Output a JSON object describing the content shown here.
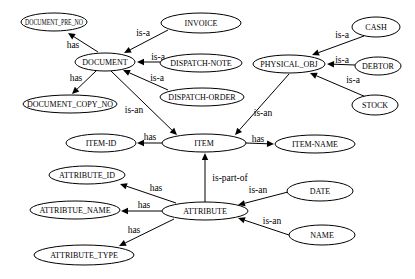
{
  "diagram": {
    "type": "entity-relationship graph",
    "nodes": [
      {
        "id": "DOCUMENT_PRE_NO",
        "label": "DOCUMENT_PRE_NO",
        "cx": 54,
        "cy": 22,
        "rx": 33,
        "ry": 9
      },
      {
        "id": "INVOICE",
        "label": "INVOICE",
        "cx": 201,
        "cy": 23,
        "rx": 40,
        "ry": 10
      },
      {
        "id": "DOCUMENT",
        "label": "DOCUMENT",
        "cx": 105,
        "cy": 62,
        "rx": 30,
        "ry": 9
      },
      {
        "id": "DISPATCH-NOTE",
        "label": "DISPATCH-NOTE",
        "cx": 201,
        "cy": 63,
        "rx": 41,
        "ry": 9
      },
      {
        "id": "DISPATCH-ORDER",
        "label": "DISPATCH-ORDER",
        "cx": 202,
        "cy": 97,
        "rx": 42,
        "ry": 9
      },
      {
        "id": "DOCUMENT_COPY_NO",
        "label": "DOCUMENT_COPY_NO",
        "cx": 70,
        "cy": 104,
        "rx": 47,
        "ry": 9
      },
      {
        "id": "CASH",
        "label": "CASH",
        "cx": 376,
        "cy": 27,
        "rx": 24,
        "ry": 10
      },
      {
        "id": "PHYSICAL_OBJ",
        "label": "PHYSICAL_OBJ",
        "cx": 289,
        "cy": 64,
        "rx": 36,
        "ry": 9
      },
      {
        "id": "DEBTOR",
        "label": "DEBTOR",
        "cx": 378,
        "cy": 66,
        "rx": 23,
        "ry": 9
      },
      {
        "id": "STOCK",
        "label": "STOCK",
        "cx": 375,
        "cy": 105,
        "rx": 23,
        "ry": 10
      },
      {
        "id": "ITEM-ID",
        "label": "ITEM-ID",
        "cx": 101,
        "cy": 143,
        "rx": 35,
        "ry": 9
      },
      {
        "id": "ITEM",
        "label": "ITEM",
        "cx": 204,
        "cy": 143,
        "rx": 42,
        "ry": 9
      },
      {
        "id": "ITEM-NAME",
        "label": "ITEM-NAME",
        "cx": 315,
        "cy": 144,
        "rx": 40,
        "ry": 9
      },
      {
        "id": "ATTRIBUTE_ID",
        "label": "ATTRIBUTE_ID",
        "cx": 87,
        "cy": 175,
        "rx": 38,
        "ry": 9
      },
      {
        "id": "DATE",
        "label": "DATE",
        "cx": 320,
        "cy": 191,
        "rx": 33,
        "ry": 10
      },
      {
        "id": "ATTRIBTUE_NAME",
        "label": "ATTRIBTUE_NAME",
        "cx": 75,
        "cy": 210,
        "rx": 45,
        "ry": 9
      },
      {
        "id": "ATTRIBUTE",
        "label": "ATTRIBUTE",
        "cx": 205,
        "cy": 211,
        "rx": 43,
        "ry": 9
      },
      {
        "id": "NAME",
        "label": "NAME",
        "cx": 322,
        "cy": 235,
        "rx": 33,
        "ry": 10
      },
      {
        "id": "ATTRIBUTE_TYPE",
        "label": "ATTRIBUTE_TYPE",
        "cx": 84,
        "cy": 255,
        "rx": 50,
        "ry": 10
      }
    ],
    "edges": [
      {
        "from": "DOCUMENT",
        "to": "DOCUMENT_PRE_NO",
        "label": "has",
        "x1": 98,
        "y1": 52,
        "x2": 68,
        "y2": 33,
        "lx": 73,
        "ly": 45
      },
      {
        "from": "DOCUMENT",
        "to": "DOCUMENT_COPY_NO",
        "label": "has",
        "x1": 96,
        "y1": 71,
        "x2": 72,
        "y2": 94,
        "lx": 76,
        "ly": 78
      },
      {
        "from": "INVOICE",
        "to": "DOCUMENT",
        "label": "is-a",
        "x1": 168,
        "y1": 30,
        "x2": 124,
        "y2": 53,
        "lx": 143,
        "ly": 33
      },
      {
        "from": "DISPATCH-NOTE",
        "to": "DOCUMENT",
        "label": "is-a",
        "x1": 160,
        "y1": 62,
        "x2": 137,
        "y2": 62,
        "lx": 158,
        "ly": 57
      },
      {
        "from": "DISPATCH-ORDER",
        "to": "DOCUMENT",
        "label": "is-a",
        "x1": 168,
        "y1": 90,
        "x2": 123,
        "y2": 70,
        "lx": 157,
        "ly": 78
      },
      {
        "from": "DOCUMENT",
        "to": "ITEM",
        "label": "is-an",
        "x1": 111,
        "y1": 71,
        "x2": 177,
        "y2": 135,
        "lx": 134,
        "ly": 110
      },
      {
        "from": "CASH",
        "to": "PHYSICAL_OBJ",
        "label": "is-a",
        "x1": 364,
        "y1": 36,
        "x2": 312,
        "y2": 55,
        "lx": 342,
        "ly": 35
      },
      {
        "from": "DEBTOR",
        "to": "PHYSICAL_OBJ",
        "label": "is-a",
        "x1": 355,
        "y1": 65,
        "x2": 327,
        "y2": 64,
        "lx": 342,
        "ly": 60
      },
      {
        "from": "STOCK",
        "to": "PHYSICAL_OBJ",
        "label": "is-a",
        "x1": 366,
        "y1": 97,
        "x2": 310,
        "y2": 73,
        "lx": 353,
        "ly": 80
      },
      {
        "from": "PHYSICAL_OBJ",
        "to": "ITEM",
        "label": "is-an",
        "x1": 289,
        "y1": 74,
        "x2": 235,
        "y2": 135,
        "lx": 263,
        "ly": 113
      },
      {
        "from": "ITEM",
        "to": "ITEM-ID",
        "label": "has",
        "x1": 162,
        "y1": 143,
        "x2": 137,
        "y2": 143,
        "lx": 150,
        "ly": 137
      },
      {
        "from": "ITEM",
        "to": "ITEM-NAME",
        "label": "has",
        "x1": 246,
        "y1": 143,
        "x2": 274,
        "y2": 144,
        "lx": 258,
        "ly": 139
      },
      {
        "from": "ATTRIBUTE",
        "to": "ITEM",
        "label": "is-part-of",
        "x1": 205,
        "y1": 202,
        "x2": 205,
        "y2": 153,
        "lx": 230,
        "ly": 178
      },
      {
        "from": "ATTRIBUTE",
        "to": "ATTRIBUTE_ID",
        "label": "has",
        "x1": 176,
        "y1": 203,
        "x2": 120,
        "y2": 184,
        "lx": 156,
        "ly": 188
      },
      {
        "from": "ATTRIBUTE",
        "to": "ATTRIBTUE_NAME",
        "label": "has",
        "x1": 162,
        "y1": 211,
        "x2": 121,
        "y2": 211,
        "lx": 144,
        "ly": 205
      },
      {
        "from": "ATTRIBUTE",
        "to": "ATTRIBUTE_TYPE",
        "label": "has",
        "x1": 174,
        "y1": 219,
        "x2": 119,
        "y2": 246,
        "lx": 134,
        "ly": 230
      },
      {
        "from": "DATE",
        "to": "ATTRIBUTE",
        "label": "is-an",
        "x1": 288,
        "y1": 192,
        "x2": 238,
        "y2": 205,
        "lx": 258,
        "ly": 190
      },
      {
        "from": "NAME",
        "to": "ATTRIBUTE",
        "label": "is-an",
        "x1": 289,
        "y1": 235,
        "x2": 238,
        "y2": 218,
        "lx": 272,
        "ly": 221
      }
    ]
  }
}
